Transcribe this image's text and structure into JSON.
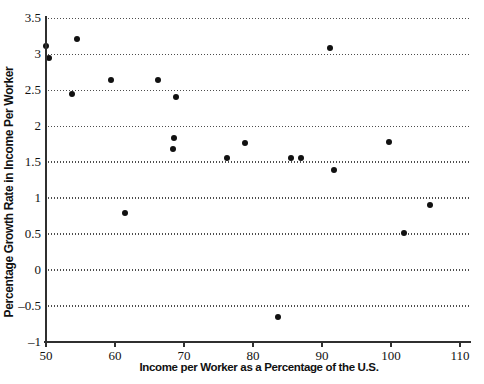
{
  "chart_data": {
    "type": "scatter",
    "title": "",
    "xlabel": "Income per Worker as a Percentage of the U.S.",
    "ylabel": "Percentage Growth Rate in Income Per Worker",
    "xlim": [
      50,
      111.6
    ],
    "ylim": [
      -1,
      3.53
    ],
    "x_ticks": [
      50,
      60,
      70,
      80,
      90,
      100,
      110
    ],
    "x_tick_labels": [
      "50",
      "60",
      "70",
      "80",
      "90",
      "100",
      "110"
    ],
    "y_ticks": [
      -1,
      -0.5,
      0,
      0.5,
      1,
      1.5,
      2,
      2.5,
      3,
      3.5
    ],
    "y_tick_labels": [
      "–1",
      "–0.5",
      "0",
      "0.5",
      "1",
      "1.5",
      "2",
      "2.5",
      "3",
      "3.5"
    ],
    "grid": "horizontal dotted lines at every y tick except -1 (axis line)",
    "legend": "none",
    "points": [
      {
        "x": 50.0,
        "y": 3.11
      },
      {
        "x": 50.5,
        "y": 2.95
      },
      {
        "x": 53.8,
        "y": 2.45
      },
      {
        "x": 54.5,
        "y": 3.21
      },
      {
        "x": 59.4,
        "y": 2.64
      },
      {
        "x": 61.5,
        "y": 0.79
      },
      {
        "x": 66.3,
        "y": 2.64
      },
      {
        "x": 68.4,
        "y": 1.68
      },
      {
        "x": 68.6,
        "y": 1.83
      },
      {
        "x": 68.8,
        "y": 2.41
      },
      {
        "x": 76.3,
        "y": 1.56
      },
      {
        "x": 78.9,
        "y": 1.77
      },
      {
        "x": 83.6,
        "y": -0.65
      },
      {
        "x": 85.5,
        "y": 1.56
      },
      {
        "x": 86.9,
        "y": 1.55
      },
      {
        "x": 91.2,
        "y": 3.08
      },
      {
        "x": 91.7,
        "y": 1.39
      },
      {
        "x": 99.7,
        "y": 1.78
      },
      {
        "x": 101.9,
        "y": 0.52
      },
      {
        "x": 105.7,
        "y": 0.91
      }
    ],
    "colors": {
      "background": "#ffffff",
      "point": "#111111",
      "grid": "#4d4d4d",
      "axis": "#2f2f2f",
      "tick_text": "#111111",
      "label_text": "#111111"
    }
  }
}
